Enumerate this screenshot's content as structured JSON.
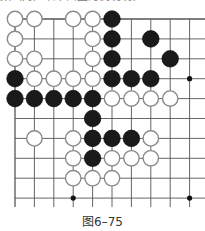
{
  "top_text": "数（对）以下面图为例说明。",
  "caption": "图6–75",
  "board": {
    "cols": 10,
    "rows": 10,
    "origin_x": 15,
    "origin_y": 19,
    "spacing_x": 19.4,
    "spacing_y": 19.9,
    "stone_radius": 8.3,
    "line_color": "#555555",
    "black_color": "#1a1a1a",
    "white_fill": "#ffffff",
    "white_stroke": "#8a8a8a",
    "star_points": [
      [
        9,
        3
      ],
      [
        3,
        9
      ],
      [
        9,
        9
      ]
    ],
    "stones": [
      {
        "c": 0,
        "r": 0,
        "color": "W"
      },
      {
        "c": 1,
        "r": 0,
        "color": "W"
      },
      {
        "c": 3,
        "r": 0,
        "color": "W"
      },
      {
        "c": 4,
        "r": 0,
        "color": "W"
      },
      {
        "c": 5,
        "r": 0,
        "color": "B"
      },
      {
        "c": 0,
        "r": 1,
        "color": "W"
      },
      {
        "c": 4,
        "r": 1,
        "color": "W"
      },
      {
        "c": 5,
        "r": 1,
        "color": "B"
      },
      {
        "c": 7,
        "r": 1,
        "color": "B"
      },
      {
        "c": 0,
        "r": 2,
        "color": "W"
      },
      {
        "c": 1,
        "r": 2,
        "color": "W"
      },
      {
        "c": 4,
        "r": 2,
        "color": "W"
      },
      {
        "c": 5,
        "r": 2,
        "color": "B"
      },
      {
        "c": 8,
        "r": 2,
        "color": "B"
      },
      {
        "c": 0,
        "r": 3,
        "color": "B"
      },
      {
        "c": 1,
        "r": 3,
        "color": "W"
      },
      {
        "c": 2,
        "r": 3,
        "color": "W"
      },
      {
        "c": 3,
        "r": 3,
        "color": "W"
      },
      {
        "c": 4,
        "r": 3,
        "color": "W"
      },
      {
        "c": 5,
        "r": 3,
        "color": "B"
      },
      {
        "c": 6,
        "r": 3,
        "color": "B"
      },
      {
        "c": 7,
        "r": 3,
        "color": "B"
      },
      {
        "c": 0,
        "r": 4,
        "color": "B"
      },
      {
        "c": 1,
        "r": 4,
        "color": "B"
      },
      {
        "c": 2,
        "r": 4,
        "color": "B"
      },
      {
        "c": 3,
        "r": 4,
        "color": "B"
      },
      {
        "c": 4,
        "r": 4,
        "color": "B"
      },
      {
        "c": 5,
        "r": 4,
        "color": "W"
      },
      {
        "c": 6,
        "r": 4,
        "color": "W"
      },
      {
        "c": 7,
        "r": 4,
        "color": "W"
      },
      {
        "c": 8,
        "r": 4,
        "color": "W"
      },
      {
        "c": 4,
        "r": 5,
        "color": "B"
      },
      {
        "c": 1,
        "r": 6,
        "color": "W"
      },
      {
        "c": 3,
        "r": 6,
        "color": "W"
      },
      {
        "c": 4,
        "r": 6,
        "color": "B"
      },
      {
        "c": 5,
        "r": 6,
        "color": "B"
      },
      {
        "c": 6,
        "r": 6,
        "color": "B"
      },
      {
        "c": 7,
        "r": 6,
        "color": "W"
      },
      {
        "c": 3,
        "r": 7,
        "color": "W"
      },
      {
        "c": 4,
        "r": 7,
        "color": "B"
      },
      {
        "c": 5,
        "r": 7,
        "color": "W"
      },
      {
        "c": 6,
        "r": 7,
        "color": "W"
      },
      {
        "c": 7,
        "r": 7,
        "color": "W"
      },
      {
        "c": 3,
        "r": 8,
        "color": "W"
      },
      {
        "c": 4,
        "r": 8,
        "color": "W"
      },
      {
        "c": 5,
        "r": 8,
        "color": "W"
      }
    ]
  }
}
